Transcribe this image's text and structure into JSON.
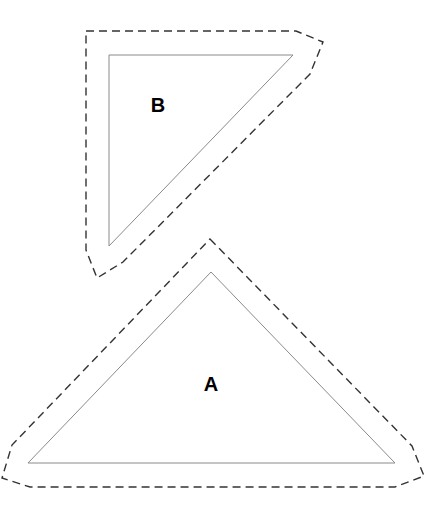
{
  "diagram": {
    "type": "polygon-offset-illustration",
    "shapes": [
      {
        "id": "A",
        "label": "A",
        "inner_triangle": [
          [
            211,
            272
          ],
          [
            28,
            463
          ],
          [
            395,
            463
          ]
        ],
        "offset_outline": "M210,239 L412,446 L424,476 L395,487 L30,487 L2,478 L12,445 Z",
        "label_pos": [
          211,
          391
        ]
      },
      {
        "id": "B",
        "label": "B",
        "inner_triangle": [
          [
            109,
            55
          ],
          [
            293,
            55
          ],
          [
            109,
            246
          ]
        ],
        "offset_outline": "M86,31 L296,31 L323,42 L310,74 L123,262 L97,278 L86,250 Z",
        "label_pos": [
          158,
          112
        ]
      }
    ],
    "colors": {
      "inner_stroke": "#8a8a8a",
      "outline_stroke": "#333333",
      "label": "#000000"
    }
  }
}
